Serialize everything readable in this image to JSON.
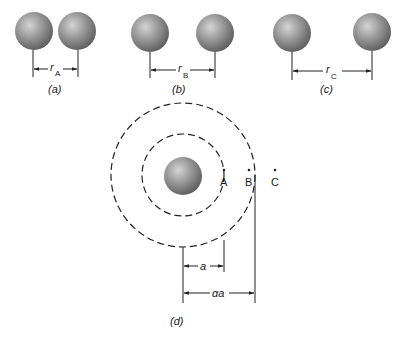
{
  "figure": {
    "panels": [
      {
        "id": "a",
        "caption": "(a)",
        "separation_label": "r",
        "separation_subscript": "A"
      },
      {
        "id": "b",
        "caption": "(b)",
        "separation_label": "r",
        "separation_subscript": "B"
      },
      {
        "id": "c",
        "caption": "(c)",
        "separation_label": "r",
        "separation_subscript": "C"
      }
    ],
    "orbit_panel": {
      "caption": "(d)",
      "points": [
        {
          "label": "A"
        },
        {
          "label": "B"
        },
        {
          "label": "C"
        }
      ],
      "inner_radius_label": "a",
      "outer_radius_label": "αa"
    },
    "colors": {
      "sphere_light": "#c9c9c9",
      "sphere_mid": "#8f8f8f",
      "sphere_dark": "#5e5e5e",
      "line": "#222222"
    }
  }
}
